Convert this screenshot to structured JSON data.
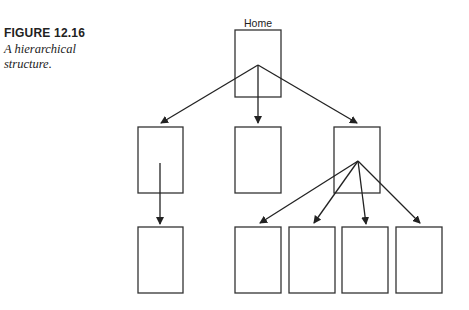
{
  "caption": {
    "figure_number": "FIGURE 12.16",
    "title_line1": "A hierarchical",
    "title_line2": "structure."
  },
  "diagram": {
    "root_label": "Home",
    "levels": [
      {
        "level": 0,
        "nodes": [
          {
            "id": "home",
            "label": "Home"
          }
        ]
      },
      {
        "level": 1,
        "nodes": [
          {
            "id": "a"
          },
          {
            "id": "b"
          },
          {
            "id": "c"
          }
        ]
      },
      {
        "level": 2,
        "nodes": [
          {
            "id": "a1",
            "parent": "a"
          },
          {
            "id": "c1",
            "parent": "c"
          },
          {
            "id": "c2",
            "parent": "c"
          },
          {
            "id": "c3",
            "parent": "c"
          },
          {
            "id": "c4",
            "parent": "c"
          }
        ]
      }
    ],
    "edges": [
      [
        "home",
        "a"
      ],
      [
        "home",
        "b"
      ],
      [
        "home",
        "c"
      ],
      [
        "a",
        "a1"
      ],
      [
        "c",
        "c1"
      ],
      [
        "c",
        "c2"
      ],
      [
        "c",
        "c3"
      ],
      [
        "c",
        "c4"
      ]
    ],
    "colors": {
      "stroke": "#333333",
      "background": "#ffffff"
    }
  }
}
